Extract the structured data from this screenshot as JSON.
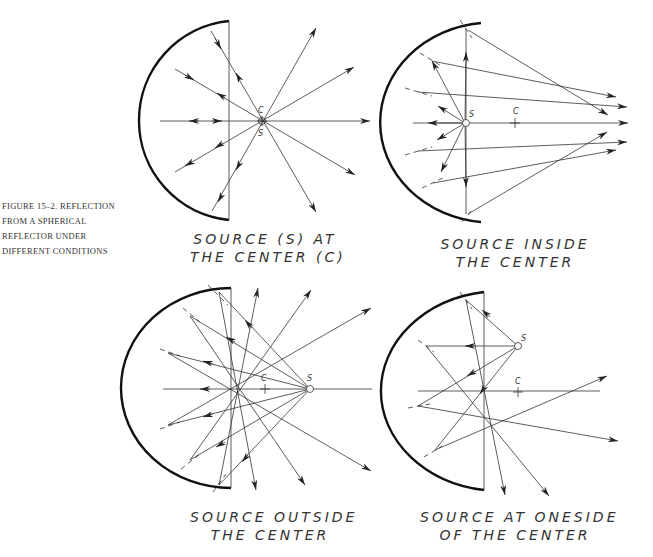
{
  "figure": {
    "caption_lines": [
      "FIGURE 15–2.   REFLECTION",
      "FROM A SPHERICAL",
      "REFLECTOR UNDER",
      "DIFFERENT CONDITIONS"
    ]
  },
  "panels": [
    {
      "id": "top-left",
      "title_lines": [
        "SOURCE (S) AT",
        "THE CENTER (C)"
      ],
      "point_labels": {
        "center": "C",
        "source": "S"
      }
    },
    {
      "id": "top-right",
      "title_lines": [
        "SOURCE INSIDE",
        "THE CENTER"
      ],
      "point_labels": {
        "center": "C",
        "source": "S"
      }
    },
    {
      "id": "bottom-left",
      "title_lines": [
        "SOURCE OUTSIDE",
        "THE CENTER"
      ],
      "point_labels": {
        "center": "C",
        "source": "S"
      }
    },
    {
      "id": "bottom-right",
      "title_lines": [
        "SOURCE AT ONESIDE",
        "OF THE CENTER"
      ],
      "point_labels": {
        "center": "C",
        "source": "S"
      }
    }
  ],
  "colors": {
    "ink": "#222222",
    "background": "#ffffff"
  }
}
